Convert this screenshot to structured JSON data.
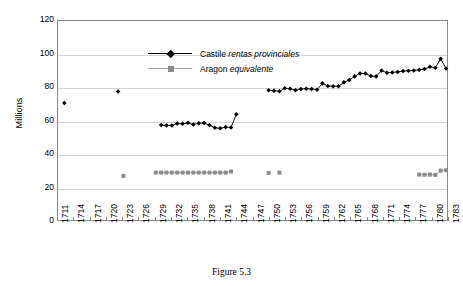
{
  "caption": "Figure 5.3",
  "chart_data": {
    "type": "scatter",
    "title": "",
    "xlabel": "",
    "ylabel": "Millions",
    "ylim": [
      0,
      120
    ],
    "yticks": [
      0,
      20,
      40,
      60,
      80,
      100,
      120
    ],
    "xlim": [
      1711,
      1783
    ],
    "xticks": [
      1711,
      1714,
      1717,
      1720,
      1723,
      1726,
      1729,
      1732,
      1735,
      1738,
      1741,
      1744,
      1747,
      1750,
      1753,
      1756,
      1759,
      1762,
      1765,
      1768,
      1771,
      1774,
      1777,
      1780,
      1783
    ],
    "grid": "horizontal",
    "legend_position": "top-left",
    "series": [
      {
        "name": "Castile rentas provinciales",
        "name_plain": "Castile ",
        "name_italic": "rentas provinciales",
        "marker": "diamond",
        "color": "#000000",
        "points": [
          {
            "x": 1712,
            "y": 70.5
          },
          {
            "x": 1722,
            "y": 77.5
          },
          {
            "x": 1730,
            "y": 57.3
          },
          {
            "x": 1731,
            "y": 57.0
          },
          {
            "x": 1732,
            "y": 57.0
          },
          {
            "x": 1733,
            "y": 58.2
          },
          {
            "x": 1734,
            "y": 58.0
          },
          {
            "x": 1735,
            "y": 58.6
          },
          {
            "x": 1736,
            "y": 57.6
          },
          {
            "x": 1737,
            "y": 58.4
          },
          {
            "x": 1738,
            "y": 58.5
          },
          {
            "x": 1739,
            "y": 57.2
          },
          {
            "x": 1740,
            "y": 55.6
          },
          {
            "x": 1741,
            "y": 55.3
          },
          {
            "x": 1742,
            "y": 56.0
          },
          {
            "x": 1743,
            "y": 55.8
          },
          {
            "x": 1744,
            "y": 63.8
          },
          {
            "x": 1750,
            "y": 78.2
          },
          {
            "x": 1751,
            "y": 78.0
          },
          {
            "x": 1752,
            "y": 77.6
          },
          {
            "x": 1753,
            "y": 79.4
          },
          {
            "x": 1754,
            "y": 79.1
          },
          {
            "x": 1755,
            "y": 78.3
          },
          {
            "x": 1756,
            "y": 79.0
          },
          {
            "x": 1757,
            "y": 79.2
          },
          {
            "x": 1758,
            "y": 79.0
          },
          {
            "x": 1759,
            "y": 78.6
          },
          {
            "x": 1760,
            "y": 82.4
          },
          {
            "x": 1761,
            "y": 80.8
          },
          {
            "x": 1762,
            "y": 80.6
          },
          {
            "x": 1763,
            "y": 80.7
          },
          {
            "x": 1764,
            "y": 83.0
          },
          {
            "x": 1765,
            "y": 84.4
          },
          {
            "x": 1766,
            "y": 86.6
          },
          {
            "x": 1767,
            "y": 88.4
          },
          {
            "x": 1768,
            "y": 88.3
          },
          {
            "x": 1769,
            "y": 86.8
          },
          {
            "x": 1770,
            "y": 86.6
          },
          {
            "x": 1771,
            "y": 90.1
          },
          {
            "x": 1772,
            "y": 88.8
          },
          {
            "x": 1773,
            "y": 89.0
          },
          {
            "x": 1774,
            "y": 89.3
          },
          {
            "x": 1775,
            "y": 89.8
          },
          {
            "x": 1776,
            "y": 90.0
          },
          {
            "x": 1777,
            "y": 90.2
          },
          {
            "x": 1778,
            "y": 90.6
          },
          {
            "x": 1779,
            "y": 91.0
          },
          {
            "x": 1780,
            "y": 92.4
          },
          {
            "x": 1781,
            "y": 91.8
          },
          {
            "x": 1782,
            "y": 97.2
          },
          {
            "x": 1783,
            "y": 91.4
          }
        ]
      },
      {
        "name": "Aragon equivalente",
        "name_plain": "Aragon ",
        "name_italic": "equivalente",
        "marker": "square",
        "color": "#8c8c8c",
        "points": [
          {
            "x": 1723,
            "y": 26.6
          },
          {
            "x": 1729,
            "y": 28.6
          },
          {
            "x": 1730,
            "y": 28.6
          },
          {
            "x": 1731,
            "y": 28.6
          },
          {
            "x": 1732,
            "y": 28.6
          },
          {
            "x": 1733,
            "y": 28.6
          },
          {
            "x": 1734,
            "y": 28.6
          },
          {
            "x": 1735,
            "y": 28.6
          },
          {
            "x": 1736,
            "y": 28.6
          },
          {
            "x": 1737,
            "y": 28.6
          },
          {
            "x": 1738,
            "y": 28.6
          },
          {
            "x": 1739,
            "y": 28.6
          },
          {
            "x": 1740,
            "y": 28.6
          },
          {
            "x": 1741,
            "y": 28.6
          },
          {
            "x": 1742,
            "y": 28.6
          },
          {
            "x": 1743,
            "y": 29.2
          },
          {
            "x": 1750,
            "y": 28.4
          },
          {
            "x": 1752,
            "y": 28.6
          },
          {
            "x": 1778,
            "y": 27.4
          },
          {
            "x": 1779,
            "y": 27.3
          },
          {
            "x": 1780,
            "y": 27.4
          },
          {
            "x": 1781,
            "y": 27.2
          },
          {
            "x": 1782,
            "y": 29.8
          },
          {
            "x": 1783,
            "y": 30.0
          }
        ]
      }
    ]
  }
}
